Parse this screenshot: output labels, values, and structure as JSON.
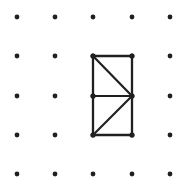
{
  "figure": {
    "title": "Geoboard dot grid with subdivided rectangle",
    "background_color": "#ffffff",
    "ink_color": "#231f20",
    "width": 182,
    "height": 180
  },
  "grid": {
    "label": "5 by 5 dot array",
    "rows": 5,
    "cols": 5,
    "x_positions": [
      17,
      55,
      93,
      132,
      170
    ],
    "y_positions": [
      17,
      56,
      96,
      135,
      174
    ],
    "dot_radius": 2.4,
    "dot_color": "#231f20",
    "spacing_x": 38.25,
    "spacing_y": 39.25
  },
  "shape": {
    "name": "rectangle-with-two-diagonals",
    "description": "Tall rectangle spanning one column by two rows, split by a horizontal midline, each half crossed by a diagonal meeting at the right midpoint",
    "stroke_width": 2.3,
    "vertices": [
      {
        "id": "top-left",
        "x": 93,
        "y": 56
      },
      {
        "id": "top-right",
        "x": 132,
        "y": 56
      },
      {
        "id": "mid-left",
        "x": 93,
        "y": 96
      },
      {
        "id": "mid-right",
        "x": 132,
        "y": 96
      },
      {
        "id": "bottom-left",
        "x": 93,
        "y": 135
      },
      {
        "id": "bottom-right",
        "x": 132,
        "y": 135
      }
    ],
    "outline": [
      {
        "id": "top-edge",
        "x1": 93,
        "y1": 56,
        "x2": 132,
        "y2": 56
      },
      {
        "id": "right-edge",
        "x1": 132,
        "y1": 56,
        "x2": 132,
        "y2": 135
      },
      {
        "id": "bottom-edge",
        "x1": 132,
        "y1": 135,
        "x2": 93,
        "y2": 135
      },
      {
        "id": "left-edge",
        "x1": 93,
        "y1": 135,
        "x2": 93,
        "y2": 56
      }
    ],
    "interior": [
      {
        "id": "midline",
        "x1": 93,
        "y1": 96,
        "x2": 132,
        "y2": 96
      },
      {
        "id": "upper-diagonal",
        "x1": 93,
        "y1": 56,
        "x2": 132,
        "y2": 96
      },
      {
        "id": "lower-diagonal",
        "x1": 93,
        "y1": 135,
        "x2": 132,
        "y2": 96
      }
    ]
  }
}
